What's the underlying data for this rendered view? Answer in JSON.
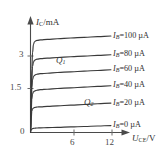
{
  "chart_data": {
    "type": "line",
    "title": "",
    "xlabel": "U_CE/V",
    "ylabel": "I_C/mA",
    "xlabel_main": "U",
    "xlabel_sub": "CE",
    "xlabel_unit": "/V",
    "ylabel_main": "I",
    "ylabel_sub": "C",
    "ylabel_unit": "/mA",
    "xlim": [
      0,
      13.5
    ],
    "ylim": [
      0,
      4.6
    ],
    "xticks": [
      6,
      12
    ],
    "xtick_labels": [
      "6",
      "12"
    ],
    "yticks": [
      1.5,
      3
    ],
    "ytick_labels": [
      "1.5",
      "3"
    ],
    "origin_label": "0",
    "grid": false,
    "legend_position": "right-inline",
    "series": [
      {
        "name": "IB=100 uA",
        "label_main": "I",
        "label_sub": "B",
        "label_rest": "=100 µA",
        "ib_uA": 100,
        "plateau_mA": 4.0,
        "knee_V": 0.55,
        "x": [
          0,
          0.1,
          0.2,
          0.3,
          0.45,
          0.6,
          0.8,
          1.0,
          1.5,
          2.5,
          4.0,
          6.0,
          8.0,
          10.0,
          12.0
        ],
        "y": [
          0,
          1.45,
          2.75,
          3.45,
          3.82,
          3.92,
          3.96,
          3.98,
          4.0,
          4.02,
          4.05,
          4.08,
          4.11,
          4.14,
          4.17
        ]
      },
      {
        "name": "IB=80 uA",
        "label_main": "I",
        "label_sub": "B",
        "label_rest": "=80 µA",
        "ib_uA": 80,
        "plateau_mA": 3.2,
        "knee_V": 0.5,
        "x": [
          0,
          0.1,
          0.2,
          0.3,
          0.45,
          0.6,
          0.8,
          1.0,
          1.5,
          2.5,
          4.0,
          6.0,
          8.0,
          10.0,
          12.0
        ],
        "y": [
          0,
          1.25,
          2.35,
          2.85,
          3.05,
          3.12,
          3.15,
          3.17,
          3.19,
          3.21,
          3.24,
          3.27,
          3.3,
          3.33,
          3.36
        ]
      },
      {
        "name": "IB=60 uA",
        "label_main": "I",
        "label_sub": "B",
        "label_rest": "=60 µA",
        "ib_uA": 60,
        "plateau_mA": 2.55,
        "knee_V": 0.45,
        "x": [
          0,
          0.1,
          0.2,
          0.3,
          0.45,
          0.6,
          0.8,
          1.0,
          1.5,
          2.5,
          4.0,
          6.0,
          8.0,
          10.0,
          12.0
        ],
        "y": [
          0,
          1.1,
          1.95,
          2.28,
          2.42,
          2.47,
          2.5,
          2.52,
          2.54,
          2.56,
          2.59,
          2.62,
          2.65,
          2.68,
          2.71
        ]
      },
      {
        "name": "IB=40 uA",
        "label_main": "I",
        "label_sub": "B",
        "label_rest": "=40 µA",
        "ib_uA": 40,
        "plateau_mA": 1.85,
        "knee_V": 0.42,
        "x": [
          0,
          0.1,
          0.2,
          0.3,
          0.45,
          0.6,
          0.8,
          1.0,
          1.5,
          2.5,
          4.0,
          6.0,
          8.0,
          10.0,
          12.0
        ],
        "y": [
          0,
          0.88,
          1.45,
          1.67,
          1.76,
          1.79,
          1.81,
          1.83,
          1.85,
          1.87,
          1.9,
          1.93,
          1.96,
          1.99,
          2.02
        ]
      },
      {
        "name": "IB=20 uA",
        "label_main": "I",
        "label_sub": "B",
        "label_rest": "=20 µA",
        "ib_uA": 20,
        "plateau_mA": 1.1,
        "knee_V": 0.38,
        "x": [
          0,
          0.1,
          0.2,
          0.3,
          0.45,
          0.6,
          0.8,
          1.0,
          1.5,
          2.5,
          4.0,
          6.0,
          8.0,
          10.0,
          12.0
        ],
        "y": [
          0,
          0.6,
          0.92,
          1.02,
          1.06,
          1.08,
          1.09,
          1.1,
          1.11,
          1.13,
          1.15,
          1.18,
          1.21,
          1.24,
          1.27
        ]
      },
      {
        "name": "IB=0 uA",
        "label_main": "I",
        "label_sub": "B",
        "label_rest": "=0 µA",
        "ib_uA": 0,
        "plateau_mA": 0.18,
        "knee_V": 0.3,
        "x": [
          0,
          0.1,
          0.2,
          0.3,
          0.45,
          0.6,
          0.8,
          1.0,
          1.5,
          2.5,
          4.0,
          6.0,
          8.0,
          10.0,
          12.0
        ],
        "y": [
          0,
          0.1,
          0.15,
          0.17,
          0.18,
          0.185,
          0.19,
          0.195,
          0.2,
          0.21,
          0.22,
          0.24,
          0.26,
          0.28,
          0.3
        ]
      }
    ],
    "annotations": [
      {
        "name": "Q1",
        "text_main": "Q",
        "text_sub": "1",
        "x_px": 56,
        "y_px": 56
      },
      {
        "name": "Q2",
        "text_main": "Q",
        "text_sub": "2",
        "x_px": 84,
        "y_px": 98
      }
    ]
  }
}
